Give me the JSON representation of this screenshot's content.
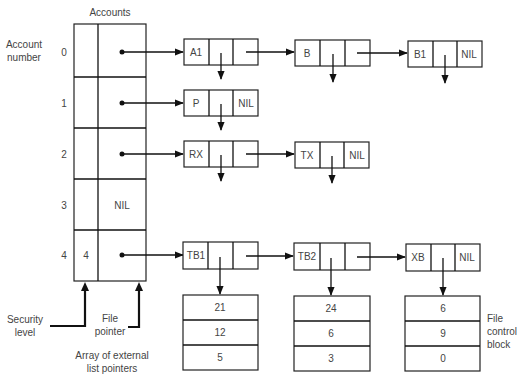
{
  "title": "Accounts",
  "labels": {
    "account_number": [
      "Account",
      "number"
    ],
    "security_level": [
      "Security",
      "level"
    ],
    "file_pointer": [
      "File",
      "pointer"
    ],
    "array_caption": [
      "Array of external",
      "list pointers"
    ],
    "fcb_caption": [
      "File",
      "control",
      "block"
    ]
  },
  "accounts": [
    {
      "index": "0",
      "security": "",
      "pointer": "dot"
    },
    {
      "index": "1",
      "security": "",
      "pointer": "dot"
    },
    {
      "index": "2",
      "security": "",
      "pointer": "dot"
    },
    {
      "index": "3",
      "security": "",
      "pointer": "NIL"
    },
    {
      "index": "4",
      "security": "4",
      "pointer": "dot"
    }
  ],
  "lists": [
    {
      "row": 0,
      "nodes": [
        {
          "name": "A1",
          "next": "ptr"
        },
        {
          "name": "B",
          "next": "ptr"
        },
        {
          "name": "B1",
          "next": "NIL"
        }
      ]
    },
    {
      "row": 1,
      "nodes": [
        {
          "name": "P",
          "next": "NIL"
        }
      ]
    },
    {
      "row": 2,
      "nodes": [
        {
          "name": "RX",
          "next": "ptr"
        },
        {
          "name": "TX",
          "next": "NIL"
        }
      ]
    },
    {
      "row": 4,
      "nodes": [
        {
          "name": "TB1",
          "next": "ptr",
          "fcb": [
            "21",
            "12",
            "5"
          ]
        },
        {
          "name": "TB2",
          "next": "ptr",
          "fcb": [
            "24",
            "6",
            "3"
          ]
        },
        {
          "name": "XB",
          "next": "NIL",
          "fcb": [
            "6",
            "9",
            "0"
          ]
        }
      ]
    }
  ],
  "nil_label": "NIL",
  "colors": {
    "line": "#111111",
    "text": "#444444",
    "background": "#ffffff"
  }
}
